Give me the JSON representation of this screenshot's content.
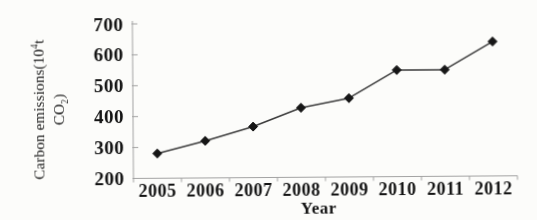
{
  "figure": {
    "background": "#fcfcfa",
    "axis_color": "#a3a3a3",
    "line_color": "#3b3b3b",
    "marker_color": "#161616",
    "text_color": "#141414"
  },
  "chart_data": {
    "type": "line",
    "title": "",
    "xlabel": "Year",
    "ylabel": "Carbon emissions(10⁴t CO₂)",
    "ylabel_parts": {
      "line1_pre": "Carbon emissions(10",
      "line1_sup": "4",
      "line1_post": "t",
      "line2_pre": "CO",
      "line2_sub": "2",
      "line2_post": ")"
    },
    "categories": [
      "2005",
      "2006",
      "2007",
      "2008",
      "2009",
      "2010",
      "2011",
      "2012"
    ],
    "values": [
      280,
      320,
      365,
      425,
      455,
      545,
      545,
      635
    ],
    "ylim": [
      200,
      700
    ],
    "yticks": [
      200,
      300,
      400,
      500,
      600,
      700
    ],
    "grid": false,
    "legend": false,
    "marker": "diamond"
  }
}
